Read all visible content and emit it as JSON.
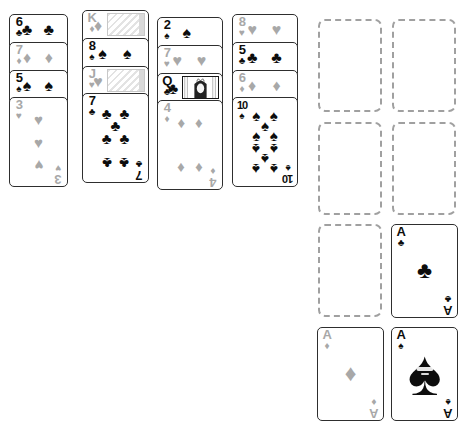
{
  "window": {
    "title": "solitaire-table"
  },
  "suit_glyphs": {
    "clubs": "♣",
    "diamonds": "♦",
    "hearts": "♥",
    "spades": "♠"
  },
  "colors": {
    "black_suit": "#0d0d0d",
    "red_suit_gray": "#a8a8a8",
    "card_border": "#2e2e2e",
    "cell_dashed_border": "#a0a0a0",
    "card_background": "#ffffff"
  },
  "tableau": {
    "piles": [
      {
        "label": "pile-1",
        "cards": [
          {
            "rank": "6",
            "suit": "clubs"
          },
          {
            "rank": "7",
            "suit": "diamonds"
          },
          {
            "rank": "5",
            "suit": "spades"
          },
          {
            "rank": "3",
            "suit": "hearts"
          }
        ]
      },
      {
        "label": "pile-2",
        "cards": [
          {
            "rank": "K",
            "suit": "diamonds"
          },
          {
            "rank": "8",
            "suit": "spades"
          },
          {
            "rank": "J",
            "suit": "hearts"
          },
          {
            "rank": "7",
            "suit": "clubs"
          }
        ]
      },
      {
        "label": "pile-3",
        "cards": [
          {
            "rank": "2",
            "suit": "spades"
          },
          {
            "rank": "7",
            "suit": "hearts"
          },
          {
            "rank": "Q",
            "suit": "clubs"
          },
          {
            "rank": "4",
            "suit": "diamonds"
          }
        ]
      },
      {
        "label": "pile-4",
        "cards": [
          {
            "rank": "8",
            "suit": "hearts"
          },
          {
            "rank": "5",
            "suit": "clubs"
          },
          {
            "rank": "6",
            "suit": "diamonds"
          },
          {
            "rank": "10",
            "suit": "spades"
          }
        ]
      }
    ]
  },
  "cells": {
    "slots": [
      {
        "row": 1,
        "col": 1,
        "card": null
      },
      {
        "row": 1,
        "col": 2,
        "card": null
      },
      {
        "row": 2,
        "col": 1,
        "card": null
      },
      {
        "row": 2,
        "col": 2,
        "card": null
      },
      {
        "row": 3,
        "col": 1,
        "card": null
      },
      {
        "row": 3,
        "col": 2,
        "card": {
          "rank": "A",
          "suit": "clubs"
        }
      },
      {
        "row": 4,
        "col": 1,
        "card": {
          "rank": "A",
          "suit": "diamonds"
        }
      },
      {
        "row": 4,
        "col": 2,
        "card": {
          "rank": "A",
          "suit": "spades",
          "ornate": true
        }
      }
    ]
  }
}
